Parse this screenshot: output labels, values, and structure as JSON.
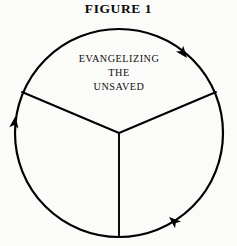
{
  "figure": {
    "title": "FIGURE 1",
    "type": "cycle-diagram",
    "background_color": "#fbfbf9",
    "stroke_color": "#000000"
  },
  "diagram": {
    "circle": {
      "center_x": 119,
      "center_y": 133,
      "radius": 104,
      "stroke_width": 2.2
    },
    "center_point": {
      "x": 119,
      "y": 133
    },
    "spokes": [
      {
        "name": "spoke-upper-left",
        "end_x": 22,
        "end_y": 92
      },
      {
        "name": "spoke-upper-right",
        "end_x": 216,
        "end_y": 92
      },
      {
        "name": "spoke-bottom",
        "end_x": 119,
        "end_y": 237
      }
    ],
    "arrows": [
      {
        "name": "arrow-upper-right",
        "x": 187,
        "y": 58,
        "rotation": 52,
        "direction": "clockwise"
      },
      {
        "name": "arrow-left",
        "x": 15.5,
        "y": 116,
        "rotation": -82,
        "direction": "clockwise"
      },
      {
        "name": "arrow-bottom-right",
        "x": 169,
        "y": 217,
        "rotation": 221,
        "direction": "clockwise"
      }
    ],
    "sectors": [
      {
        "name": "sector-top",
        "lines": [
          "EVANGELIZING",
          "THE",
          "UNSAVED"
        ],
        "label_x": 119,
        "label_ys": [
          62,
          76,
          90
        ]
      },
      {
        "name": "sector-lower-left",
        "lines": []
      },
      {
        "name": "sector-lower-right",
        "lines": []
      }
    ]
  }
}
